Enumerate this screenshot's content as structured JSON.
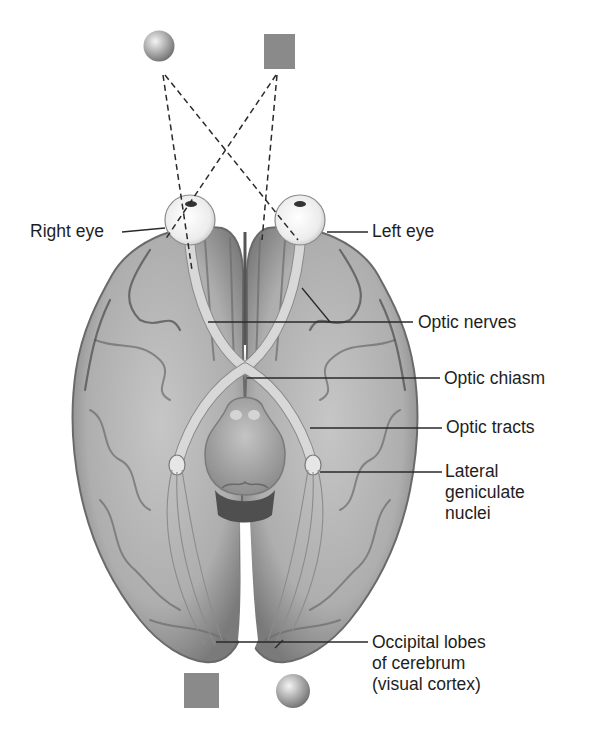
{
  "figure": {
    "stimuli": {
      "top": [
        {
          "shape": "sphere",
          "position": "left",
          "color": "#a8a8a8"
        },
        {
          "shape": "square",
          "position": "right",
          "color": "#8a8a8a"
        }
      ],
      "bottom": [
        {
          "shape": "square",
          "position": "left",
          "color": "#8a8a8a"
        },
        {
          "shape": "sphere",
          "position": "right",
          "color": "#a8a8a8"
        }
      ]
    },
    "colors": {
      "background": "#ffffff",
      "brain_light": "#c9c9c9",
      "brain_mid": "#a0a0a0",
      "brain_dark": "#6a6a6a",
      "eye": "#f2f2f2",
      "text": "#1e1e1e",
      "leader_line": "#2a2a2a"
    }
  },
  "labels": {
    "right_eye": "Right eye",
    "left_eye": "Left eye",
    "optic_nerves": "Optic nerves",
    "optic_chiasm": "Optic chiasm",
    "optic_tracts": "Optic tracts",
    "lateral_geniculate": "Lateral\ngeniculate\nnuclei",
    "occipital_lobes": "Occipital lobes\nof cerebrum\n(visual cortex)"
  }
}
